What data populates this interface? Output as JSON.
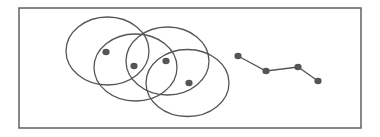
{
  "diagram": {
    "colors": {
      "stroke": "#555555",
      "frame": "#606060",
      "dot_fill": "#555555",
      "background": "#ffffff"
    },
    "frame": {
      "x": 19,
      "y": 8,
      "width": 342,
      "height": 120
    },
    "ellipses": [
      {
        "cx": 107.5,
        "cy": 51,
        "rx": 41.5,
        "ry": 34
      },
      {
        "cx": 135.5,
        "cy": 67.5,
        "rx": 41.5,
        "ry": 33.5
      },
      {
        "cx": 167.5,
        "cy": 61,
        "rx": 41.5,
        "ry": 34
      },
      {
        "cx": 187.5,
        "cy": 83,
        "rx": 41.5,
        "ry": 33.5
      }
    ],
    "cluster_points": [
      {
        "x": 106,
        "y": 52
      },
      {
        "x": 134,
        "y": 66
      },
      {
        "x": 166,
        "y": 61
      },
      {
        "x": 189,
        "y": 83
      }
    ],
    "chain_points": [
      {
        "x": 238,
        "y": 56
      },
      {
        "x": 266,
        "y": 71
      },
      {
        "x": 298,
        "y": 67
      },
      {
        "x": 318,
        "y": 81
      }
    ]
  }
}
